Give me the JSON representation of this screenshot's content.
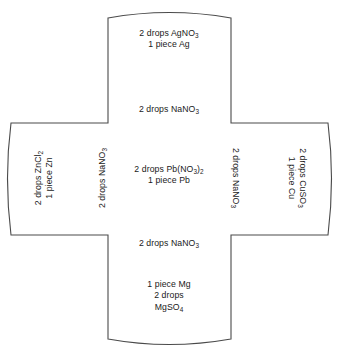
{
  "figure": {
    "shape": "cross",
    "stroke_color": "#4a4a4a",
    "fill_color": "#ffffff",
    "text_color": "#1a1a1a"
  },
  "cells": {
    "top": {
      "name": "silver-half-cell",
      "line1_pre": "2 drops AgNO",
      "line1_sub": "3",
      "line2": "1 piece Ag"
    },
    "left": {
      "name": "zinc-half-cell",
      "line1_pre": "2 drops ZnCl",
      "line1_sub": "2",
      "line2": "1 piece Zn"
    },
    "center": {
      "name": "lead-half-cell",
      "line1_pre": "2 drops Pb(NO",
      "line1_sub": "3",
      "line1_mid": ")",
      "line1_sub2": "2",
      "line2": "1 piece Pb"
    },
    "right": {
      "name": "copper-half-cell",
      "line1_pre": "2 drops CuSO",
      "line1_sub": "3",
      "line2": "1 piece Cu"
    },
    "bottom": {
      "name": "magnesium-half-cell",
      "line1": "1 piece Mg",
      "line2": "2 drops",
      "line3_pre": "MgSO",
      "line3_sub": "4"
    }
  },
  "salt_bridges": {
    "top": {
      "text_pre": "2 drops NaNO",
      "text_sub": "3"
    },
    "bottom": {
      "text_pre": "2 drops NaNO",
      "text_sub": "3"
    },
    "left": {
      "text_pre": "2 drops NaNO",
      "text_sub": "3"
    },
    "right": {
      "text_pre": "2 drops NaNO",
      "text_sub": "3"
    }
  }
}
